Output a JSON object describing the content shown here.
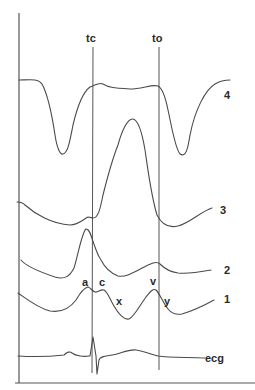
{
  "figure": {
    "type": "waveform-diagram",
    "markers": [
      {
        "id": "tc",
        "label": "tc",
        "x": 93
      },
      {
        "id": "to",
        "label": "to",
        "x": 159
      }
    ],
    "traces": [
      {
        "id": "trace-4",
        "label": "4"
      },
      {
        "id": "trace-3",
        "label": "3"
      },
      {
        "id": "trace-2",
        "label": "2"
      },
      {
        "id": "trace-1",
        "label": "1",
        "wave_labels": [
          "a",
          "c",
          "x",
          "v",
          "y"
        ]
      },
      {
        "id": "trace-ecg",
        "label": "ecg"
      }
    ],
    "colors": {
      "background": "#ffffff",
      "line": "#4a4a4a",
      "text": "#2a2a2a"
    }
  }
}
